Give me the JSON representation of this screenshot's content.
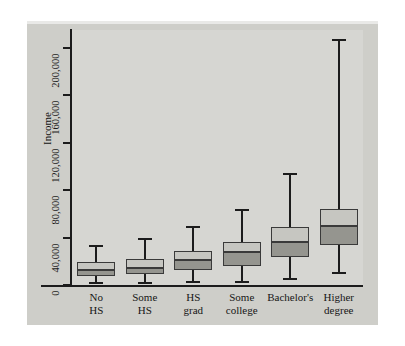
{
  "chart_data": {
    "type": "box",
    "title": "",
    "xlabel": "",
    "ylabel": "Income",
    "ylim": [
      0,
      215000
    ],
    "grid": false,
    "legend": "none",
    "y_ticks": [
      0,
      40000,
      80000,
      120000,
      160000,
      200000
    ],
    "y_tick_labels": [
      "0",
      "40,000",
      "80,000",
      "120,000",
      "160,000",
      "200,000"
    ],
    "categories": [
      "No HS",
      "Some HS",
      "HS grad",
      "Some college",
      "Bachelor's",
      "Higher degree"
    ],
    "category_lines": [
      [
        "No",
        "HS"
      ],
      [
        "Some",
        "HS"
      ],
      [
        "HS",
        "grad"
      ],
      [
        "Some",
        "college"
      ],
      [
        "Bachelor's",
        ""
      ],
      [
        "Higher",
        "degree"
      ]
    ],
    "boxes": [
      {
        "category": "No HS",
        "whisker_low": 2000,
        "q1": 8000,
        "median": 13000,
        "q3": 19000,
        "whisker_high": 33000
      },
      {
        "category": "Some HS",
        "whisker_low": 1500,
        "q1": 9000,
        "median": 14000,
        "q3": 22000,
        "whisker_high": 39000
      },
      {
        "category": "HS grad",
        "whisker_low": 2500,
        "q1": 13000,
        "median": 21000,
        "q3": 29000,
        "whisker_high": 49000
      },
      {
        "category": "Some college",
        "whisker_low": 2500,
        "q1": 16000,
        "median": 28000,
        "q3": 36000,
        "whisker_high": 63000
      },
      {
        "category": "Bachelor's",
        "whisker_low": 5000,
        "q1": 24000,
        "median": 36000,
        "q3": 49000,
        "whisker_high": 94000
      },
      {
        "category": "Higher degree",
        "whisker_low": 10000,
        "q1": 34000,
        "median": 50000,
        "q3": 64000,
        "whisker_high": 207000
      }
    ],
    "units": "US dollars"
  }
}
